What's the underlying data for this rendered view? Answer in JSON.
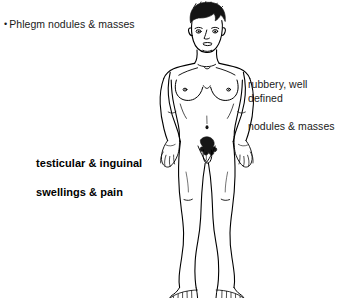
{
  "image": {
    "kind": "anatomical-line-illustration",
    "subject": "standing adult male front view",
    "background_color": "#ffffff",
    "line_color": "#000000",
    "width": 344,
    "height": 298
  },
  "annotations": {
    "bullet": {
      "marker": "•",
      "text": "Phlegm nodules & masses",
      "style": "regular"
    },
    "right": {
      "line1": "rubbery, well defined",
      "line2": "nodules & masses",
      "style": "regular"
    },
    "left": {
      "line1": "testicular & inguinal",
      "line2": "swellings & pain",
      "style": "bold"
    }
  },
  "figure_parts": {
    "hair": "short dark hair",
    "face": "eyes, nose, mouth",
    "neck": "neck with clavicles",
    "chest": "pectorals with nipples",
    "abdomen": "navel",
    "groin": "shaded genital region",
    "arms": "arms at sides with open hands",
    "legs": "legs with knee creases",
    "feet": "bare feet with toes"
  }
}
